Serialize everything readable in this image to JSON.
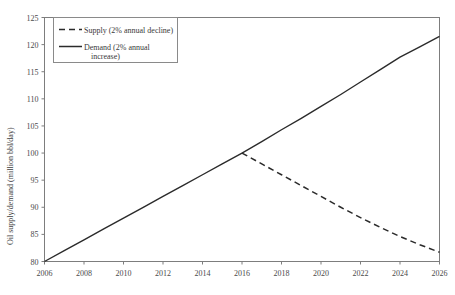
{
  "chart_data": {
    "type": "line",
    "title": "",
    "xlabel": "",
    "ylabel": "Oil supply/demand (million bbl/day)",
    "xlim": [
      2006,
      2026
    ],
    "ylim": [
      80,
      125
    ],
    "grid": false,
    "legend_position": "top-left",
    "xticks": [
      2006,
      2008,
      2010,
      2012,
      2014,
      2016,
      2018,
      2020,
      2022,
      2024,
      2026
    ],
    "xtick_labels": [
      "2006",
      "2008",
      "2010",
      "2012",
      "2014",
      "2016",
      "2018",
      "2020",
      "2022",
      "2024",
      "2026"
    ],
    "yticks": [
      80,
      85,
      90,
      95,
      100,
      105,
      110,
      115,
      120,
      125
    ],
    "ytick_labels": [
      "80",
      "85",
      "90",
      "95",
      "100",
      "105",
      "110",
      "115",
      "120",
      "125"
    ],
    "x": [
      2006,
      2007,
      2008,
      2009,
      2010,
      2011,
      2012,
      2013,
      2014,
      2015,
      2016,
      2017,
      2018,
      2019,
      2020,
      2021,
      2022,
      2023,
      2024,
      2025,
      2026
    ],
    "series": [
      {
        "name": "Supply (2% annual decline)",
        "style": "dashed",
        "color": "#2b2b2b",
        "values": [
          80.0,
          82.0,
          84.0,
          86.0,
          88.0,
          90.0,
          92.0,
          94.0,
          96.0,
          98.0,
          100.0,
          98.0,
          96.0,
          94.0,
          92.0,
          90.0,
          88.1,
          86.3,
          84.6,
          83.1,
          81.7
        ]
      },
      {
        "name": "Demand (2% annual increase)",
        "style": "solid",
        "color": "#2b2b2b",
        "values": [
          80.0,
          82.0,
          84.0,
          86.0,
          88.0,
          90.0,
          92.0,
          94.0,
          96.0,
          98.0,
          100.0,
          102.1,
          104.3,
          106.4,
          108.6,
          110.8,
          113.1,
          115.4,
          117.7,
          119.6,
          121.5
        ]
      }
    ],
    "annotations": {
      "divergence_year": 2016,
      "divergence_value": 100
    }
  },
  "legend": {
    "entries": [
      {
        "label": "Supply (2% annual decline)",
        "style": "dashed"
      },
      {
        "label": "Demand (2% annual",
        "label2": "increase)",
        "style": "solid"
      }
    ]
  }
}
